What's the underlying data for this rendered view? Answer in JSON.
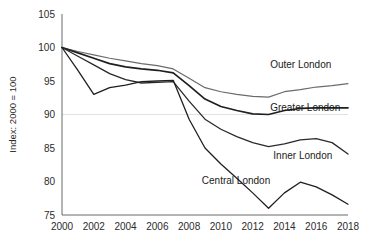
{
  "chart_data": {
    "type": "line",
    "title": "",
    "xlabel": "",
    "ylabel": "Index: 2000 = 100",
    "xlim": [
      2000,
      2018
    ],
    "ylim": [
      75,
      105
    ],
    "yticks": [
      75,
      80,
      85,
      90,
      95,
      100,
      105
    ],
    "xticks": [
      2000,
      2002,
      2004,
      2006,
      2008,
      2010,
      2012,
      2014,
      2016,
      2018
    ],
    "xtick_labels": [
      "2000",
      "2002",
      "2004",
      "2006",
      "2008",
      "2010",
      "2012",
      "2014",
      "2016",
      "2018"
    ],
    "ytick_labels": [
      "75",
      "80",
      "85",
      "90",
      "95",
      "100",
      "105"
    ],
    "grid": "horizontal-only-at-90",
    "legend": "inline-series-labels",
    "x": [
      2000,
      2001,
      2002,
      2003,
      2004,
      2005,
      2006,
      2007,
      2008,
      2009,
      2010,
      2011,
      2012,
      2013,
      2014,
      2015,
      2016,
      2017,
      2018
    ],
    "series": [
      {
        "name": "Outer London",
        "color": "#6b6b6b",
        "width": 1.2,
        "label_x": 2013.1,
        "label_y": 96.9,
        "values": [
          100.0,
          99.4,
          98.9,
          98.4,
          98.0,
          97.6,
          97.3,
          96.8,
          95.4,
          94.0,
          93.4,
          93.0,
          92.7,
          92.6,
          93.4,
          93.7,
          94.1,
          94.3,
          94.6
        ]
      },
      {
        "name": "Greater London",
        "color": "#1f1f1f",
        "width": 1.7,
        "label_x": 2013.1,
        "label_y": 90.5,
        "values": [
          100.0,
          99.2,
          98.4,
          97.6,
          97.1,
          96.8,
          96.6,
          96.2,
          94.3,
          92.3,
          91.2,
          90.6,
          90.1,
          90.0,
          90.6,
          90.9,
          91.0,
          91.0,
          91.0
        ]
      },
      {
        "name": "Inner London",
        "color": "#2a2a2a",
        "width": 1.3,
        "label_x": 2013.3,
        "label_y": 83.3,
        "values": [
          100.0,
          98.7,
          97.4,
          96.1,
          95.2,
          94.7,
          94.8,
          94.9,
          92.0,
          89.3,
          87.8,
          86.7,
          85.8,
          85.2,
          85.6,
          86.2,
          86.4,
          85.8,
          84.1
        ]
      },
      {
        "name": "Central London",
        "color": "#1f1f1f",
        "width": 1.3,
        "label_x": 2008.8,
        "label_y": 79.6,
        "values": [
          100.0,
          96.6,
          93.0,
          94.0,
          94.4,
          94.9,
          95.0,
          95.1,
          89.3,
          85.0,
          82.6,
          80.5,
          78.3,
          76.0,
          78.3,
          79.9,
          79.2,
          78.0,
          76.6
        ]
      }
    ]
  }
}
